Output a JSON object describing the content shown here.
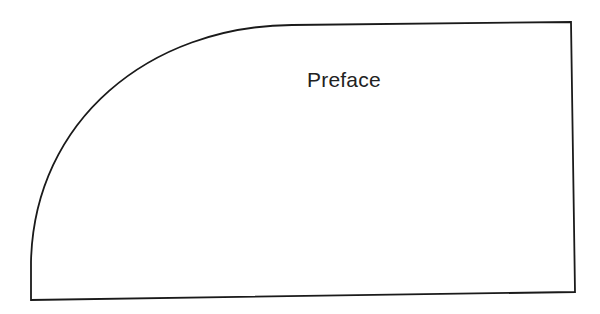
{
  "page": {
    "heading": "Preface"
  },
  "colors": {
    "background": "#ffffff",
    "stroke": "#1a1a1a",
    "text": "#222222"
  }
}
